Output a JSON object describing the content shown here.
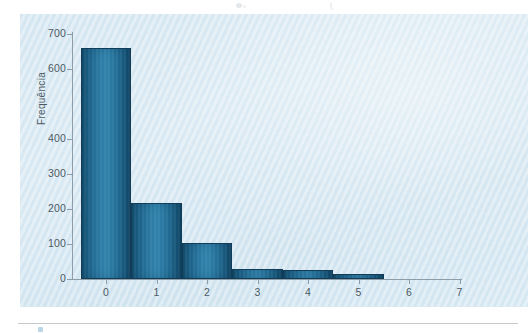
{
  "figure": {
    "panel_bg": "#d6e8f2",
    "bar_color": "#1f6d96",
    "bar_edge": "#123d58",
    "axis_color": "#8d9ca6",
    "text_color": "#4d5a63"
  },
  "chart_data": {
    "type": "bar",
    "title": "",
    "xlabel": "",
    "ylabel": "Frequência",
    "categories": [
      "0",
      "1",
      "2",
      "3",
      "4",
      "5"
    ],
    "values": [
      660,
      218,
      103,
      30,
      25,
      15
    ],
    "x_ticks": [
      "0",
      "1",
      "2",
      "3",
      "4",
      "5",
      "6",
      "7"
    ],
    "y_ticks": [
      "0",
      "100",
      "200",
      "300",
      "400",
      "600",
      "700"
    ],
    "y_tick_values": [
      0,
      100,
      200,
      300,
      400,
      600,
      700
    ],
    "ylim": [
      0,
      700
    ],
    "xlim": [
      -0.5,
      7.3
    ],
    "grid": false,
    "legend": null,
    "bar_width": 1.0,
    "note_missing_tick_label": "500"
  }
}
